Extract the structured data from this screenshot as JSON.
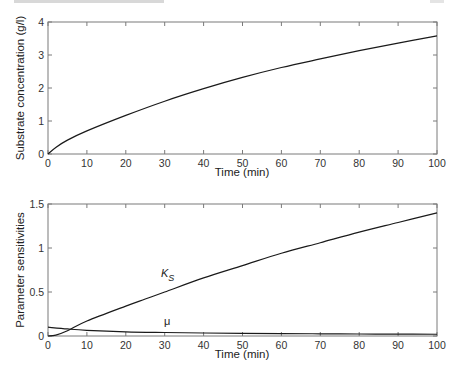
{
  "chart_data": [
    {
      "type": "line",
      "title": "",
      "xlabel": "Time (min)",
      "ylabel": "Substrate concentration (g/l)",
      "xlim": [
        0,
        100
      ],
      "ylim": [
        0,
        4
      ],
      "xticks": [
        0,
        10,
        20,
        30,
        40,
        50,
        60,
        70,
        80,
        90,
        100
      ],
      "yticks": [
        0,
        1,
        2,
        3,
        4
      ],
      "grid": false,
      "legend": null,
      "series": [
        {
          "name": "Substrate concentration",
          "x": [
            0,
            2,
            5,
            10,
            20,
            30,
            40,
            50,
            60,
            70,
            80,
            90,
            100
          ],
          "y": [
            0,
            0.2,
            0.42,
            0.7,
            1.17,
            1.6,
            1.98,
            2.32,
            2.62,
            2.88,
            3.13,
            3.36,
            3.58
          ]
        }
      ]
    },
    {
      "type": "line",
      "title": "",
      "xlabel": "Time (min)",
      "ylabel": "Parameter sensitivities",
      "xlim": [
        0,
        100
      ],
      "ylim": [
        0,
        1.5
      ],
      "xticks": [
        0,
        10,
        20,
        30,
        40,
        50,
        60,
        70,
        80,
        90,
        100
      ],
      "yticks": [
        0,
        0.5,
        1,
        1.5
      ],
      "ytick_labels": [
        "0",
        "0.5",
        "1",
        "1.5"
      ],
      "grid": false,
      "legend": null,
      "annotations": [
        {
          "text": "K",
          "subscript": "S",
          "near_x": 31,
          "near_y": 0.78
        },
        {
          "text": "μ",
          "near_x": 30,
          "near_y": 0.06
        }
      ],
      "series": [
        {
          "name": "K_S",
          "x": [
            0,
            2,
            5,
            10,
            20,
            25,
            30,
            40,
            50,
            60,
            70,
            80,
            90,
            100
          ],
          "y": [
            0,
            0.01,
            0.06,
            0.17,
            0.34,
            0.42,
            0.5,
            0.66,
            0.8,
            0.94,
            1.06,
            1.18,
            1.29,
            1.4
          ]
        },
        {
          "name": "μ",
          "x": [
            0,
            5,
            10,
            20,
            30,
            40,
            50,
            60,
            70,
            80,
            90,
            100
          ],
          "y": [
            0.1,
            0.08,
            0.065,
            0.048,
            0.04,
            0.034,
            0.03,
            0.027,
            0.025,
            0.023,
            0.021,
            0.02
          ]
        }
      ]
    }
  ],
  "plots": {
    "top": {
      "xlabel": "Time (min)",
      "ylabel": "Substrate concentration (g/l)",
      "xtick_labels": [
        "0",
        "10",
        "20",
        "30",
        "40",
        "50",
        "60",
        "70",
        "80",
        "90",
        "100"
      ],
      "ytick_labels": [
        "0",
        "1",
        "2",
        "3",
        "4"
      ]
    },
    "bottom": {
      "xlabel": "Time (min)",
      "ylabel": "Parameter sensitivities",
      "xtick_labels": [
        "0",
        "10",
        "20",
        "30",
        "40",
        "50",
        "60",
        "70",
        "80",
        "90",
        "100"
      ],
      "ytick_labels": [
        "0",
        "0.5",
        "1",
        "1.5"
      ],
      "ks_label": "K",
      "ks_sub": "S",
      "mu_label": "μ"
    }
  },
  "colors": {
    "axis": "#7a7a7a",
    "curve": "#1a1a1a",
    "background": "#ffffff"
  }
}
